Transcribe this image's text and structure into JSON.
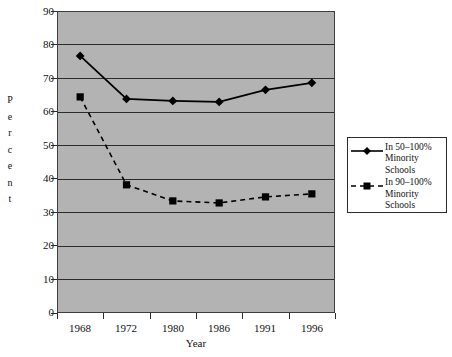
{
  "chart_data": {
    "type": "line",
    "title": "",
    "xlabel": "Year",
    "ylabel": "Percent",
    "categories": [
      "1968",
      "1972",
      "1980",
      "1986",
      "1991",
      "1996"
    ],
    "ylim": [
      0,
      90
    ],
    "yticks": [
      0,
      10,
      20,
      30,
      40,
      50,
      60,
      70,
      80,
      90
    ],
    "grid": true,
    "legend_position": "right",
    "series": [
      {
        "name": "In 50–100% Minority Schools",
        "marker": "diamond",
        "linestyle": "solid",
        "color": "#000000",
        "values": [
          76.6,
          63.8,
          63.2,
          62.9,
          66.5,
          68.6
        ]
      },
      {
        "name": "In 90–100% Minority Schools",
        "marker": "square",
        "linestyle": "dashed",
        "color": "#000000",
        "values": [
          64.4,
          38.2,
          33.4,
          32.8,
          34.6,
          35.5
        ]
      }
    ]
  },
  "axes": {
    "y_title_letters": [
      "P",
      "e",
      "r",
      "c",
      "e",
      "n",
      "t"
    ],
    "y_tick_labels": [
      "90",
      "80",
      "70",
      "60",
      "50",
      "40",
      "30",
      "20",
      "10",
      "0"
    ],
    "x_tick_labels": [
      "1968",
      "1972",
      "1980",
      "1986",
      "1991",
      "1996"
    ],
    "x_title": "Year"
  },
  "legend": {
    "entries": [
      {
        "marker": "diamond",
        "linestyle": "solid",
        "line1": "In 50–100%",
        "line2": "Minority",
        "line3": "Schools"
      },
      {
        "marker": "square",
        "linestyle": "dashed",
        "line1": "In 90–100%",
        "line2": "Minority",
        "line3": "Schools"
      }
    ]
  },
  "colors": {
    "plot_background": "#b3b3b3",
    "page_background": "#ffffff",
    "gridline": "#2b2b2b",
    "frame": "#3d3d3d",
    "series": "#000000"
  }
}
